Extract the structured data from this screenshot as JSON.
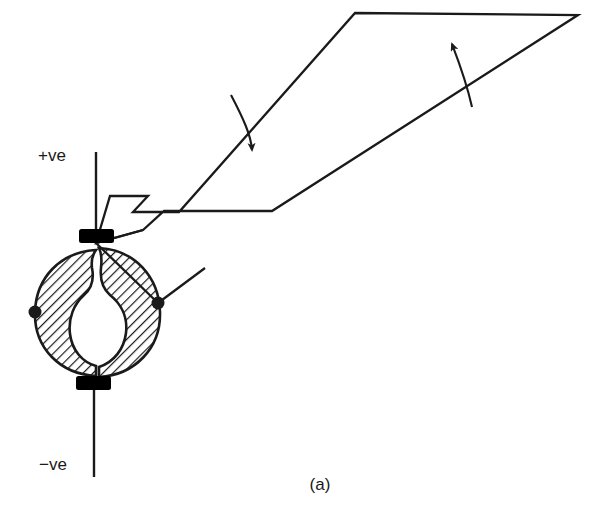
{
  "figure": {
    "caption": "(a)",
    "background_color": "#ffffff",
    "stroke_color": "#1a1a1a"
  },
  "labels": {
    "positive_terminal": "+ve",
    "negative_terminal": "−ve"
  },
  "components": {
    "rotor": {
      "name": "split-hatched-rotor",
      "center_x": 96,
      "center_y": 312,
      "radius_x": 62,
      "radius_y": 62,
      "hatch_angle_deg": 45,
      "hatch_spacing": 7,
      "fill": "none",
      "stroke": "#1a1a1a"
    },
    "cavity": {
      "name": "inner-bulb-cavity",
      "shape": "vase",
      "fill": "#ffffff"
    },
    "top_contact": {
      "name": "top-contact-block",
      "x": 79,
      "y": 229,
      "width": 35,
      "height": 14,
      "fill": "#000000"
    },
    "bottom_contact": {
      "name": "bottom-contact-block",
      "x": 76,
      "y": 376,
      "width": 35,
      "height": 14,
      "fill": "#000000"
    },
    "top_lead": {
      "name": "positive-lead-wire",
      "x": 96,
      "y1": 152,
      "y2": 229
    },
    "bottom_lead": {
      "name": "negative-lead-wire",
      "x": 94,
      "y1": 390,
      "y2": 477
    },
    "left_node": {
      "name": "left-connection-node",
      "cx": 35,
      "cy": 312,
      "r": 6.5
    },
    "right_node": {
      "name": "right-connection-node",
      "cx": 158,
      "cy": 303,
      "r": 6.5
    },
    "vane": {
      "name": "vane-blade-polygon",
      "points": "110,196 148,196 133,212 179,212 355,13 578,15 272,211 164,211 143,230 96,243",
      "fill": "none",
      "stroke": "#1a1a1a"
    }
  },
  "annotations": {
    "arrow_down": {
      "name": "rotation-arrow-down",
      "direction": "down-right",
      "start_x": 232,
      "start_y": 97,
      "end_x": 253,
      "end_y": 156
    },
    "arrow_up": {
      "name": "rotation-arrow-up",
      "direction": "up-left",
      "start_x": 472,
      "start_y": 106,
      "end_x": 450,
      "end_y": 38
    }
  }
}
